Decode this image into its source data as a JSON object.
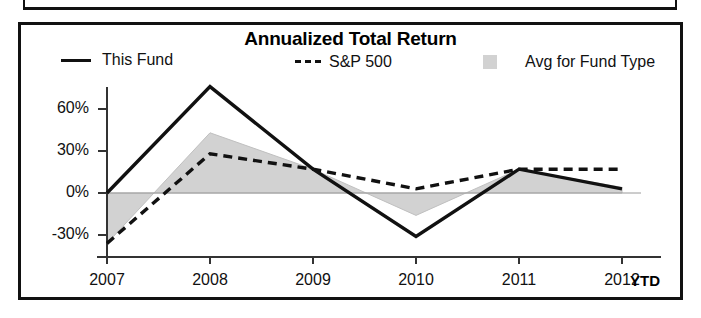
{
  "chart_data": {
    "type": "line",
    "title": "Annualized Total Return",
    "xlabel": "",
    "ylabel": "",
    "x": [
      "2007",
      "2008",
      "2009",
      "2010",
      "2011",
      "2012"
    ],
    "categories": [
      "2007",
      "2008",
      "2009",
      "2010",
      "2011",
      "2012"
    ],
    "x_note": "YTD",
    "ytick_labels": [
      "60%",
      "30%",
      "0%",
      "-30%"
    ],
    "ytick_values": [
      60,
      30,
      0,
      -30
    ],
    "ylim": [
      -45,
      85
    ],
    "grid": false,
    "legend_position": "top",
    "zero_line": true,
    "series": [
      {
        "name": "This Fund",
        "style": "solid",
        "color": "#111111",
        "values": [
          0,
          76,
          17,
          -31,
          17,
          3
        ]
      },
      {
        "name": "S&P 500",
        "style": "dashed",
        "color": "#111111",
        "values": [
          -36,
          28,
          17,
          3,
          17,
          17
        ]
      },
      {
        "name": "Avg for Fund Type",
        "style": "shaded-band",
        "color": "#d2d2d2",
        "values": [
          -36,
          43,
          17,
          -16,
          17,
          4
        ]
      }
    ]
  },
  "legend": {
    "items": [
      {
        "label": "This Fund",
        "marker": "solid-line-swatch"
      },
      {
        "label": "S&P 500",
        "marker": "dashed-line-swatch"
      },
      {
        "label": "Avg for Fund Type",
        "marker": "gray-box-swatch"
      }
    ]
  },
  "axis": {
    "y_labels": [
      "60%",
      "30%",
      "0%",
      "-30%"
    ],
    "x_labels": [
      "2007",
      "2008",
      "2009",
      "2010",
      "2011",
      "2012"
    ],
    "x_suffix": "YTD"
  },
  "colors": {
    "line": "#111111",
    "band": "#d2d2d2",
    "frame": "#111111",
    "background": "#ffffff"
  }
}
